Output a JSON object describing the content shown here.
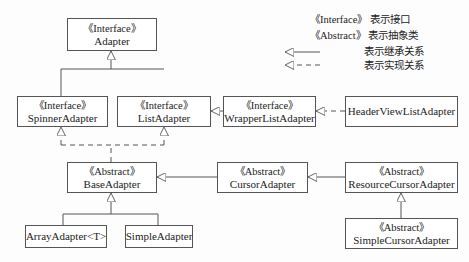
{
  "diagram": {
    "type": "uml-class-hierarchy",
    "nodes": {
      "adapter": {
        "stereotype": "《Interface》",
        "name": "Adapter"
      },
      "spinner_adapter": {
        "stereotype": "《Interface》",
        "name": "SpinnerAdapter"
      },
      "list_adapter": {
        "stereotype": "《Interface》",
        "name": "ListAdapter"
      },
      "wrapper_list_adapter": {
        "stereotype": "《Interface》",
        "name": "WrapperListAdapter"
      },
      "header_view_list_adapter": {
        "name": "HeaderViewListAdapter"
      },
      "base_adapter": {
        "stereotype": "《Abstract》",
        "name": "BaseAdapter"
      },
      "cursor_adapter": {
        "stereotype": "《Abstract》",
        "name": "CursorAdapter"
      },
      "resource_cursor_adapter": {
        "stereotype": "《Abstract》",
        "name": "ResourceCursorAdapter"
      },
      "simple_cursor_adapter": {
        "stereotype": "《Abstract》",
        "name": "SimpleCursorAdapter"
      },
      "array_adapter": {
        "name": "ArrayAdapter<T>"
      },
      "simple_adapter": {
        "name": "SimpleAdapter"
      }
    },
    "edges": [
      {
        "from": "SpinnerAdapter",
        "to": "Adapter",
        "kind": "inheritance"
      },
      {
        "from": "ListAdapter",
        "to": "Adapter",
        "kind": "inheritance"
      },
      {
        "from": "WrapperListAdapter",
        "to": "ListAdapter",
        "kind": "inheritance"
      },
      {
        "from": "HeaderViewListAdapter",
        "to": "WrapperListAdapter",
        "kind": "realization"
      },
      {
        "from": "BaseAdapter",
        "to": "SpinnerAdapter",
        "kind": "realization"
      },
      {
        "from": "BaseAdapter",
        "to": "ListAdapter",
        "kind": "realization"
      },
      {
        "from": "CursorAdapter",
        "to": "BaseAdapter",
        "kind": "inheritance"
      },
      {
        "from": "ResourceCursorAdapter",
        "to": "CursorAdapter",
        "kind": "inheritance"
      },
      {
        "from": "SimpleCursorAdapter",
        "to": "ResourceCursorAdapter",
        "kind": "inheritance"
      },
      {
        "from": "ArrayAdapter<T>",
        "to": "BaseAdapter",
        "kind": "inheritance"
      },
      {
        "from": "SimpleAdapter",
        "to": "BaseAdapter",
        "kind": "inheritance"
      }
    ]
  },
  "legend": {
    "interface_key": "《Interface》",
    "interface_desc": "表示接口",
    "abstract_key": "《Abstract》",
    "abstract_desc": "表示抽象类",
    "inheritance_desc": "表示继承关系",
    "realization_desc": "表示实现关系"
  },
  "colors": {
    "line": "#555555",
    "text": "#222222",
    "background": "#fdfdfd"
  }
}
